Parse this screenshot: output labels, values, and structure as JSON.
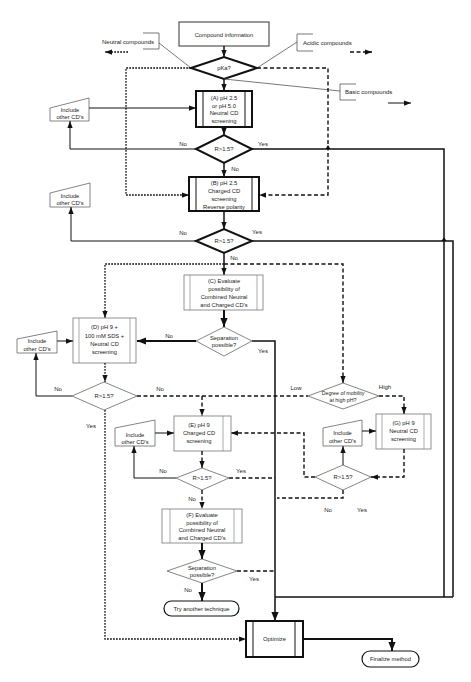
{
  "diagram": {
    "start": "Compound information",
    "pka_decision": "pKa?",
    "callouts": {
      "neutral": "Neutral compounds",
      "acidic": "Acidic compounds",
      "basic": "Basic compounds"
    },
    "steps": {
      "A": [
        "(A) pH 2.5",
        "or pH 5.0",
        "Neutral CD",
        "screening"
      ],
      "B": [
        "(B) pH 2.5",
        "Charged CD",
        "screening",
        "Reverse polarity"
      ],
      "C": [
        "(C) Evaluate",
        "possibility of",
        "Combined Neutral",
        "and Charged CD's"
      ],
      "D": [
        "(D) pH 9 +",
        "100 mM SDS +",
        "Neutral CD",
        "screening"
      ],
      "E": [
        "(E) pH 9",
        "Charged CD",
        "screening"
      ],
      "F": [
        "(F) Evaluate",
        "possibility of",
        "Combined Neutral",
        "and Charged CD's"
      ],
      "G": [
        "(G) pH 9",
        "Neutral CD",
        "screening"
      ],
      "optimize": "Optimize"
    },
    "include_other_cds": [
      "Include",
      "other CD's"
    ],
    "decisions": {
      "resolution": "R>1.5?",
      "separation": [
        "Separation",
        "possible?"
      ],
      "mobility": [
        "Degree of mobility",
        "at high pH?"
      ]
    },
    "terminals": {
      "try_another": "Try another technique",
      "finalize": "Finalize method"
    },
    "edge_labels": {
      "no": "No",
      "yes": "Yes",
      "low": "Low",
      "high": "High"
    },
    "colors": {
      "line": "#111111",
      "thin_border": "#777777",
      "background": "#ffffff"
    }
  }
}
